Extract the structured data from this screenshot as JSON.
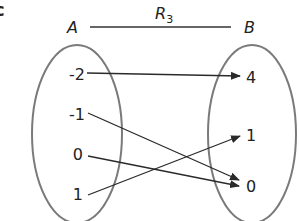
{
  "figure": {
    "part_label": "c",
    "relation_label": "R",
    "relation_subscript": "3",
    "domain_label": "A",
    "codomain_label": "B"
  },
  "domain_set": {
    "elements": [
      "-2",
      "-1",
      "0",
      "1"
    ]
  },
  "codomain_set": {
    "elements": [
      "4",
      "1",
      "0"
    ]
  },
  "mappings": [
    {
      "from": "-2",
      "to": "4"
    },
    {
      "from": "-1",
      "to": "0"
    },
    {
      "from": "0",
      "to": "0"
    },
    {
      "from": "1",
      "to": "1"
    }
  ],
  "colors": {
    "ellipse": "#7a7a7a",
    "arrow": "#2a2a2a",
    "text": "#222222"
  }
}
